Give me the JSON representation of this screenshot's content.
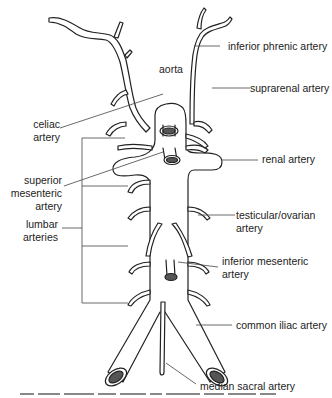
{
  "diagram": {
    "title": "aorta",
    "colors": {
      "outline": "#222222",
      "fill": "#ffffff",
      "lumen": "#555555",
      "leader": "#444444"
    },
    "labels": {
      "aorta": "aorta",
      "inferior_phrenic": "inferior phrenic artery",
      "suprarenal": "suprarenal artery",
      "celiac_1": "celiac",
      "celiac_2": "artery",
      "renal": "renal artery",
      "superior_mesenteric_1": "superior",
      "superior_mesenteric_2": "mesenteric",
      "superior_mesenteric_3": "artery",
      "testicular_1": "testicular/ovarian",
      "testicular_2": "artery",
      "lumbar_1": "lumbar",
      "lumbar_2": "arteries",
      "inferior_mesenteric_1": "inferior mesenteric",
      "inferior_mesenteric_2": "artery",
      "common_iliac": "common iliac artery",
      "median_sacral": "median sacral artery"
    }
  }
}
